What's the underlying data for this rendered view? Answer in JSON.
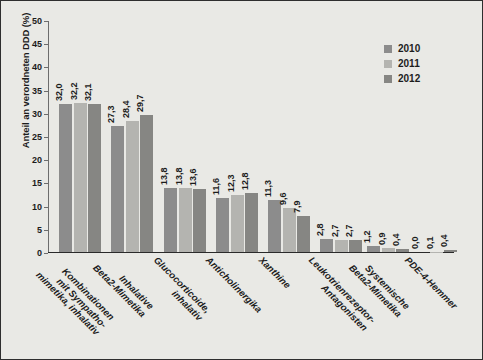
{
  "chart_data": {
    "type": "bar",
    "title": "",
    "subtitle": "",
    "xlabel": "",
    "ylabel": "Anteil an verordneten DDD (%)",
    "ylim": [
      0,
      50
    ],
    "yticks": [
      0,
      5,
      10,
      15,
      20,
      25,
      30,
      35,
      40,
      45,
      50
    ],
    "ytick_labels": [
      "0",
      "5",
      "10",
      "15",
      "20",
      "25",
      "30",
      "35",
      "40",
      "45",
      "50"
    ],
    "grid": false,
    "legend_position": "top-right",
    "decimal_separator": ",",
    "categories": [
      "Kombinationen mit Sympatho-mimetika, inhalativ",
      "Inhalative Beta2-Mimetika",
      "Glucocorticoide, inhalativ",
      "Anticholinergika",
      "Xanthine",
      "Leukotrienrezeptor-Antagonisten",
      "Systemische Beta2-Mimetika",
      "PDE-4-Hemmer"
    ],
    "category_lines": [
      [
        "Kombinationen",
        "mit Sympatho-",
        "mimetika, inhalativ"
      ],
      [
        "Inhalative",
        "Beta2-Mimetika"
      ],
      [
        "Glucocorticoide,",
        "inhalativ"
      ],
      [
        "Anticholinergika"
      ],
      [
        "Xanthine"
      ],
      [
        "Leukotrienrezeptor-",
        "Antagonisten"
      ],
      [
        "Systemische",
        "Beta2-Mimetika"
      ],
      [
        "PDE-4-Hemmer"
      ]
    ],
    "series": [
      {
        "name": "2010",
        "color": "#8c8c8c",
        "values": [
          32.0,
          27.3,
          13.8,
          11.6,
          11.3,
          2.8,
          1.2,
          0.0
        ],
        "labels": [
          "32,0",
          "27,3",
          "13,8",
          "11,6",
          "11,3",
          "2,8",
          "1,2",
          "0,0"
        ]
      },
      {
        "name": "2011",
        "color": "#b4b4b0",
        "values": [
          32.2,
          28.4,
          13.8,
          12.3,
          9.6,
          2.7,
          0.9,
          0.1
        ],
        "labels": [
          "32,2",
          "28,4",
          "13,8",
          "12,3",
          "9,6",
          "2,7",
          "0,9",
          "0,1"
        ]
      },
      {
        "name": "2012",
        "color": "#868683",
        "values": [
          32.1,
          29.7,
          13.6,
          12.8,
          7.9,
          2.7,
          0.7,
          0.4
        ],
        "labels": [
          "32,1",
          "29,7",
          "13,6",
          "12,8",
          "7,9",
          "2,7",
          "0,4",
          "0,4"
        ]
      }
    ]
  },
  "legend": {
    "items": [
      {
        "label": "2010",
        "color": "#8c8c8c"
      },
      {
        "label": "2011",
        "color": "#b4b4b0"
      },
      {
        "label": "2012",
        "color": "#868683"
      }
    ]
  },
  "axes": {
    "y_title": "Anteil an verordneten DDD (%)"
  },
  "colors": {
    "background": "#e9e9e5",
    "border": "#2e2e2e",
    "text": "#1c1c1c",
    "axis": "#6d6d6d"
  }
}
